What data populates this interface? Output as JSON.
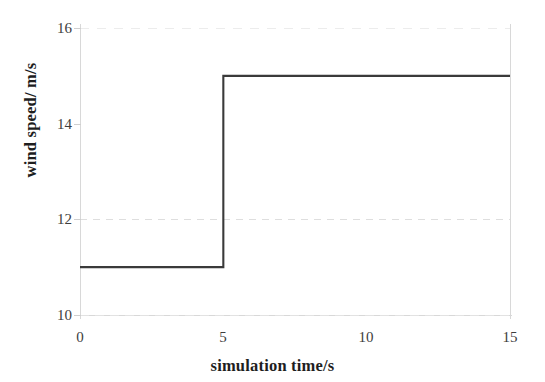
{
  "chart_data": {
    "type": "line",
    "subtype": "step",
    "title": "",
    "subtitle": "",
    "xlabel": "simulation time/s",
    "ylabel": "wind speed/ m/s",
    "xlim": [
      0,
      15
    ],
    "ylim": [
      10,
      16
    ],
    "xticks": [
      0,
      5,
      10,
      15
    ],
    "yticks": [
      10,
      12,
      14,
      16
    ],
    "xtick_labels": [
      "0",
      "5",
      "10",
      "15"
    ],
    "ytick_labels": [
      "10",
      "12",
      "14",
      "16"
    ],
    "grid": "faint dashed horizontal",
    "legend": null,
    "line_color": "#3a3a3a",
    "background_color": "#ffffff",
    "series": [
      {
        "name": "wind speed",
        "x": [
          0,
          5,
          5,
          15
        ],
        "y": [
          11,
          11,
          15,
          15
        ],
        "step_time_s": 5,
        "low_value": 11,
        "high_value": 15
      }
    ]
  },
  "axes": {
    "y_ticks": [
      {
        "label": "16",
        "value": 16
      },
      {
        "label": "14",
        "value": 14
      },
      {
        "label": "12",
        "value": 12
      },
      {
        "label": "10",
        "value": 10
      }
    ],
    "x_ticks": [
      {
        "label": "0",
        "value": 0
      },
      {
        "label": "5",
        "value": 5
      },
      {
        "label": "10",
        "value": 10
      },
      {
        "label": "15",
        "value": 15
      }
    ],
    "y_title": "wind speed/ m/s",
    "x_title": "simulation time/s"
  }
}
